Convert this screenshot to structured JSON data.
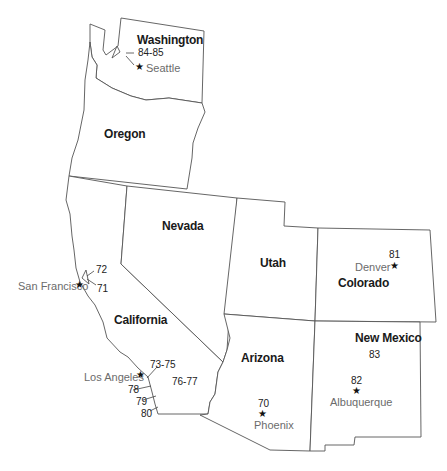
{
  "map": {
    "region": "Western United States",
    "states": [
      {
        "name": "Washington"
      },
      {
        "name": "Oregon"
      },
      {
        "name": "California"
      },
      {
        "name": "Nevada"
      },
      {
        "name": "Utah"
      },
      {
        "name": "Colorado"
      },
      {
        "name": "Arizona"
      },
      {
        "name": "New Mexico"
      }
    ],
    "cities": [
      {
        "name": "Seattle",
        "marker": "star-icon",
        "label": "84-85"
      },
      {
        "name": "San Francisco",
        "marker": "star-icon",
        "labels": [
          "72",
          "71"
        ]
      },
      {
        "name": "Los Angeles",
        "marker": "star-icon",
        "labels": [
          "73-75",
          "78",
          "79",
          "80"
        ]
      },
      {
        "name": "Phoenix",
        "marker": "star-icon",
        "label": "70"
      },
      {
        "name": "Denver",
        "marker": "star-icon",
        "label": "81"
      },
      {
        "name": "Albuquerque",
        "marker": "star-icon",
        "label": "82"
      }
    ],
    "region_numbers": [
      {
        "state": "California",
        "label": "76-77"
      },
      {
        "state": "New Mexico",
        "label": "83"
      }
    ],
    "star_glyph": "★",
    "colors": {
      "outline": "#555555",
      "state_label": "#1a1a1a",
      "city_label": "#6b6b6b",
      "number_label": "#222222",
      "background": "#ffffff"
    }
  }
}
